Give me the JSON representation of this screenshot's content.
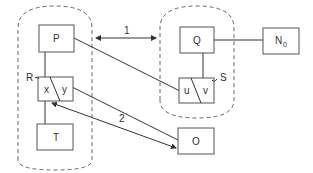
{
  "diagram": {
    "nodes": {
      "P": "P",
      "Q": "Q",
      "N": "N",
      "N_sub": "0",
      "T": "T",
      "O": "O",
      "x": "x",
      "y": "y",
      "u": "u",
      "v": "v"
    },
    "labels": {
      "R": "R",
      "S": "S",
      "arrow1": "1",
      "arrow2": "2"
    }
  }
}
